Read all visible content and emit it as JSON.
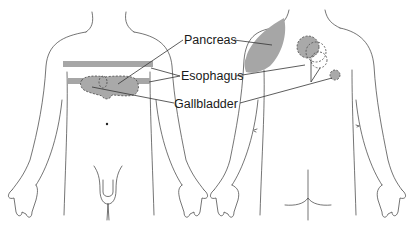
{
  "figure": {
    "type": "anatomical referred-pain diagram",
    "views": [
      "anterior",
      "posterior"
    ],
    "fill_color": "#a6a6a6",
    "line_color": "#3a3a3a"
  },
  "labels": {
    "pancreas": "Pancreas",
    "esophagus": "Esophagus",
    "gallbladder": "Gallbladder"
  }
}
